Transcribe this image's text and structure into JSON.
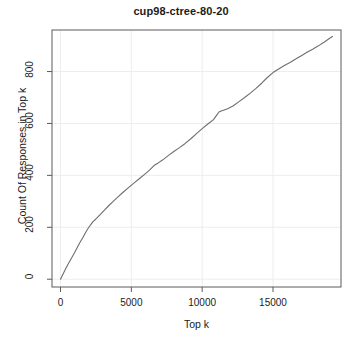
{
  "chart_data": {
    "type": "line",
    "title": "cup98-ctree-80-20",
    "xlabel": "Top k",
    "ylabel": "Count Of Responses in Top k",
    "xlim": [
      -600,
      19800
    ],
    "ylim": [
      -30,
      960
    ],
    "xticks": [
      0,
      5000,
      10000,
      15000
    ],
    "xtick_labels": [
      "0",
      "5000",
      "10000",
      "15000"
    ],
    "yticks": [
      0,
      200,
      400,
      600,
      800
    ],
    "ytick_labels": [
      "0",
      "200",
      "400",
      "600",
      "800"
    ],
    "grid": true,
    "grid_color": "#ededed",
    "legend": null,
    "line_color": "#6e6e6e",
    "series": [
      {
        "name": "cup98-ctree-80-20",
        "x": [
          0,
          200,
          400,
          600,
          800,
          1000,
          1200,
          1400,
          1600,
          1800,
          2000,
          2200,
          2300,
          2500,
          2800,
          3100,
          3400,
          3700,
          4000,
          4400,
          4800,
          5200,
          5600,
          6000,
          6300,
          6600,
          6900,
          7200,
          7600,
          8000,
          8400,
          8800,
          9200,
          9600,
          10000,
          10400,
          10800,
          11000,
          11200,
          11500,
          11800,
          12200,
          12600,
          13000,
          13400,
          13800,
          14200,
          14600,
          15000,
          15400,
          15800,
          16200,
          16600,
          17000,
          17400,
          17800,
          18200,
          18600,
          19000,
          19200
        ],
        "y": [
          0,
          22,
          44,
          64,
          84,
          103,
          124,
          144,
          163,
          183,
          200,
          215,
          222,
          232,
          249,
          266,
          283,
          299,
          314,
          334,
          353,
          371,
          389,
          407,
          421,
          438,
          448,
          459,
          476,
          492,
          507,
          523,
          541,
          561,
          580,
          598,
          615,
          630,
          645,
          651,
          657,
          668,
          684,
          700,
          717,
          735,
          755,
          777,
          796,
          810,
          823,
          835,
          848,
          861,
          874,
          886,
          899,
          913,
          928,
          935
        ]
      }
    ]
  },
  "plot_geometry": {
    "left": 52,
    "right": 341,
    "top": 30,
    "bottom": 287
  }
}
